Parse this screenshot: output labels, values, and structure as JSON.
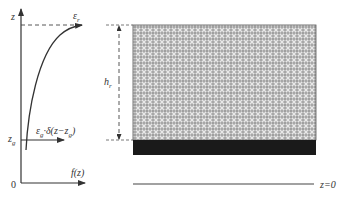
{
  "profile_plot": {
    "y_axis_label": "z",
    "x_axis_label": "f(z)",
    "origin_label": "0",
    "zg_label_main": "z",
    "zg_label_sub": "g",
    "curve_label_main": "ε",
    "curve_label_sub": "r",
    "delta_label": {
      "eps": "ε",
      "eps_sub": "g",
      "rest": "·δ(z−z",
      "zsub": "g",
      "close": ")"
    }
  },
  "canopy_diagram": {
    "height_label_main": "h",
    "height_label_sub": "r",
    "ground_label": "z=0"
  },
  "colors": {
    "line": "#333333",
    "hatch_fill": "#9a9a9a",
    "hatch_light": "#e0e0e0",
    "ground_band": "#1a1a1a"
  }
}
